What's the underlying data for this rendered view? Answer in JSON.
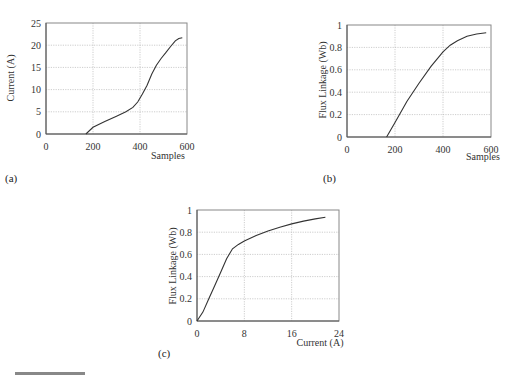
{
  "chart_data": [
    {
      "id": "a",
      "type": "line",
      "panel_label": "(a)",
      "title": "",
      "xlabel": "Samples",
      "ylabel": "Current (A)",
      "xlim": [
        0,
        600
      ],
      "ylim": [
        0,
        25
      ],
      "xticks": [
        0,
        200,
        400,
        600
      ],
      "yticks": [
        0,
        5,
        10,
        15,
        20,
        25
      ],
      "grid": true,
      "series": [
        {
          "name": "Current",
          "x": [
            170,
            200,
            250,
            300,
            340,
            370,
            390,
            410,
            430,
            450,
            470,
            490,
            510,
            530,
            550,
            565,
            580
          ],
          "y": [
            0,
            1.5,
            2.8,
            4.0,
            5.0,
            6.0,
            7.2,
            9.0,
            11.0,
            13.5,
            15.5,
            17.0,
            18.3,
            19.7,
            21.0,
            21.5,
            21.7
          ]
        }
      ]
    },
    {
      "id": "b",
      "type": "line",
      "panel_label": "(b)",
      "title": "",
      "xlabel": "Samples",
      "ylabel": "Flux Linkage (Wb)",
      "xlim": [
        0,
        600
      ],
      "ylim": [
        0,
        1
      ],
      "xticks": [
        0,
        200,
        400,
        600
      ],
      "yticks": [
        0,
        0.2,
        0.4,
        0.6,
        0.8,
        1
      ],
      "grid": true,
      "series": [
        {
          "name": "Flux Linkage",
          "x": [
            165,
            200,
            250,
            300,
            350,
            400,
            430,
            460,
            500,
            540,
            580
          ],
          "y": [
            0,
            0.13,
            0.32,
            0.48,
            0.63,
            0.76,
            0.82,
            0.86,
            0.9,
            0.92,
            0.93
          ]
        }
      ]
    },
    {
      "id": "c",
      "type": "line",
      "panel_label": "(c)",
      "title": "",
      "xlabel": "Current (A)",
      "ylabel": "Flux Linkage (Wb)",
      "xlim": [
        0,
        24
      ],
      "ylim": [
        0,
        1
      ],
      "xticks": [
        0,
        8,
        16,
        24
      ],
      "yticks": [
        0,
        0.2,
        0.4,
        0.6,
        0.8,
        1
      ],
      "grid": true,
      "series": [
        {
          "name": "Flux vs Current",
          "x": [
            0,
            1,
            2,
            3,
            4,
            5,
            6,
            7,
            8,
            10,
            12,
            14,
            16,
            18,
            20,
            21.7
          ],
          "y": [
            0,
            0.08,
            0.2,
            0.32,
            0.44,
            0.56,
            0.65,
            0.69,
            0.72,
            0.77,
            0.81,
            0.845,
            0.875,
            0.9,
            0.92,
            0.935
          ]
        }
      ]
    }
  ]
}
